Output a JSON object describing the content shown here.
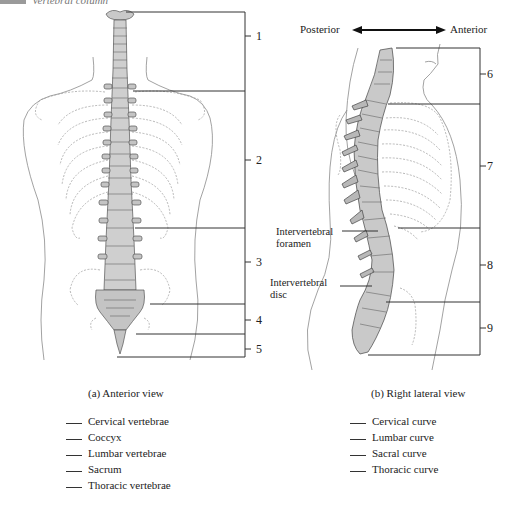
{
  "header": {
    "section_title": "Vertebral column"
  },
  "orientation": {
    "left": "Posterior",
    "right": "Anterior"
  },
  "anterior_view": {
    "caption": "(a) Anterior view",
    "leader_numbers": [
      "1",
      "2",
      "3",
      "4",
      "5"
    ],
    "answer_list": [
      "Cervical vertebrae",
      "Coccyx",
      "Lumbar vertebrae",
      "Sacrum",
      "Thoracic vertebrae"
    ]
  },
  "lateral_view": {
    "caption": "(b) Right lateral view",
    "leader_numbers": [
      "6",
      "7",
      "8",
      "9"
    ],
    "structure_labels": {
      "foramen": "Intervertebral foramen",
      "foramen_line1": "Intervertebral",
      "foramen_line2": "foramen",
      "disc_line1": "Intervertebral",
      "disc_line2": "disc"
    },
    "answer_list": [
      "Cervical curve",
      "Lumbar curve",
      "Sacral curve",
      "Thoracic curve"
    ]
  },
  "colors": {
    "bone_fill": "#c9c9c9",
    "line": "#333333",
    "outline": "#888888"
  }
}
